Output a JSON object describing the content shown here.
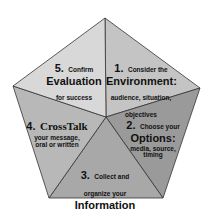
{
  "diagram": {
    "shape": "pentagon",
    "colors": {
      "outline": "#333333",
      "segment_1": "#c4c4c4",
      "segment_2": "#9a9a9a",
      "segment_3": "#a8a8a8",
      "segment_4": "#b8b8b8",
      "segment_5": "#d8d8d8"
    },
    "segments": [
      {
        "number": "1.",
        "intro": "Consider the",
        "keyword": "Environment:",
        "detail": "audience, situation, objectives"
      },
      {
        "number": "2.",
        "intro": "Choose your",
        "keyword": "Options:",
        "detail": "media, source, timing"
      },
      {
        "number": "3.",
        "intro": "Collect and organize your",
        "keyword": "Information",
        "detail": ""
      },
      {
        "number": "4.",
        "intro": "",
        "keyword": "CrossTalk",
        "detail": "your message, oral or written"
      },
      {
        "number": "5.",
        "intro": "Confirm",
        "keyword": "Evaluation",
        "detail": "for success"
      }
    ]
  }
}
